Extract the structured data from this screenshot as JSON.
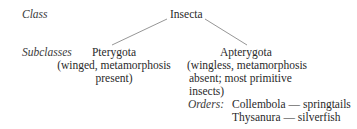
{
  "diagram": {
    "type": "taxonomy-tree",
    "row_labels": {
      "class": "Class",
      "subclasses": "Subclasses"
    },
    "root": {
      "name": "Insecta"
    },
    "subclasses": [
      {
        "name": "Pterygota",
        "description_lines": [
          "(winged, metamorphosis",
          "present)"
        ]
      },
      {
        "name": "Apterygota",
        "description_lines": [
          "(wingless, metamorphosis",
          "absent; most primitive",
          "insects)"
        ],
        "orders_label": "Orders:",
        "orders": [
          "Collembola — springtails",
          "Thysanura — silverfish"
        ]
      }
    ],
    "edges": [
      {
        "from": "Insecta",
        "to": "Pterygota"
      },
      {
        "from": "Insecta",
        "to": "Apterygota"
      }
    ],
    "line_color": "#8a8a8a"
  }
}
